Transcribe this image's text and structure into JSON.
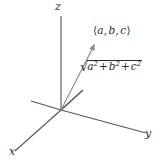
{
  "figure": {
    "background_color": "#ffffff",
    "axis_color": "#555555",
    "vector_color": "#8c8c8c",
    "text_color": "#2b2b2b"
  },
  "axes": {
    "z_label": "z",
    "y_label": "y",
    "x_label": "x",
    "origin": {
      "x": 61,
      "y": 110
    },
    "z_tip": {
      "x": 61,
      "y": 16
    },
    "y_tip": {
      "x": 146,
      "y": 133
    },
    "x_tip": {
      "x": 15,
      "y": 151
    },
    "neg_y_tip": {
      "x": 31,
      "y": 101
    },
    "neg_x_tip": {
      "x": 83,
      "y": 90
    }
  },
  "vector": {
    "point_label_open": "⟨",
    "point_label_close": "⟩",
    "component_a": "a",
    "component_b": "b",
    "component_c": "c",
    "comma": ",",
    "tail": {
      "x": 61,
      "y": 110
    },
    "head": {
      "x": 96,
      "y": 42
    }
  },
  "magnitude": {
    "radical_sign": "√",
    "term1_base": "a",
    "term1_exp": "2",
    "plus1": "+",
    "term2_base": "b",
    "term2_exp": "2",
    "plus2": "+",
    "term3_base": "c",
    "term3_exp": "2"
  }
}
